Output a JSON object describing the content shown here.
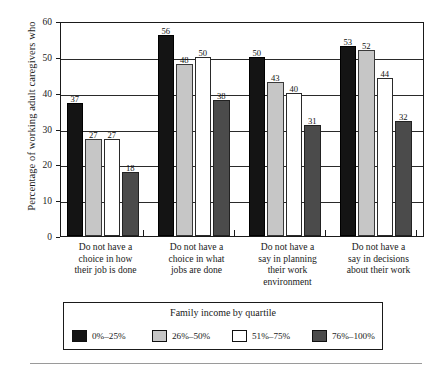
{
  "chart_data": {
    "type": "bar",
    "title": "",
    "xlabel": "",
    "ylabel": "Percentage of working adult caregivers who",
    "ylim": [
      0,
      60
    ],
    "yticks": [
      0,
      10,
      20,
      30,
      40,
      50,
      60
    ],
    "grid": "horizontal",
    "legend_position": "bottom",
    "legend_title": "Family income by quartile",
    "categories": [
      "Do not have a choice in how their job is done",
      "Do not have a choice in what jobs are done",
      "Do not have a say in planning their work environment",
      "Do not have a say in decisions about their work"
    ],
    "category_lines": [
      [
        "Do not have a",
        "choice in how",
        "their job is done"
      ],
      [
        "Do not have a",
        "choice in what",
        "jobs are done"
      ],
      [
        "Do not have a",
        "say in planning",
        "their work",
        "environment"
      ],
      [
        "Do not have a",
        "say in decisions",
        "about their work"
      ]
    ],
    "series": [
      {
        "name": "0%–25%",
        "color": "#141414",
        "values": [
          37,
          56,
          50,
          53
        ]
      },
      {
        "name": "26%–50%",
        "color": "#c6c6c6",
        "values": [
          27,
          48,
          43,
          52
        ]
      },
      {
        "name": "51%–75%",
        "color": "#ffffff",
        "values": [
          27,
          50,
          40,
          44
        ]
      },
      {
        "name": "76%–100%",
        "color": "#4b4b4b",
        "values": [
          18,
          38,
          31,
          32
        ]
      }
    ]
  }
}
